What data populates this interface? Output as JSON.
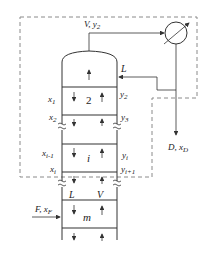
{
  "diagram": {
    "colors": {
      "line": "#333333",
      "dashed": "#8a8a8a",
      "background": "#ffffff"
    },
    "labels": {
      "vapor_top": "V",
      "vapor_top_comp": "y",
      "vapor_top_sub": "2",
      "reflux": "L",
      "distillate": "D",
      "distillate_comp": "x",
      "distillate_sub": "D",
      "plate_top_number": "2",
      "x1": "x",
      "x1_sub": "1",
      "x2": "x",
      "x2_sub": "2",
      "y2": "y",
      "y2_sub": "2",
      "y3": "y",
      "y3_sub": "3",
      "xi_minus_1": "x",
      "xi_minus_1_sub": "i-1",
      "plate_i": "i",
      "yi": "y",
      "yi_sub": "i",
      "xi": "x",
      "xi_sub": "i",
      "yi_plus_1": "y",
      "yi_plus_1_sub": "i+1",
      "feed_L": "L",
      "feed_V": "V",
      "feed": "F",
      "feed_comp": "x",
      "feed_sub": "F",
      "plate_m": "m"
    },
    "components": [
      {
        "name": "column",
        "type": "distillation-column"
      },
      {
        "name": "condenser",
        "type": "heat-exchanger"
      },
      {
        "name": "control-volume",
        "type": "dashed-boundary"
      }
    ]
  }
}
